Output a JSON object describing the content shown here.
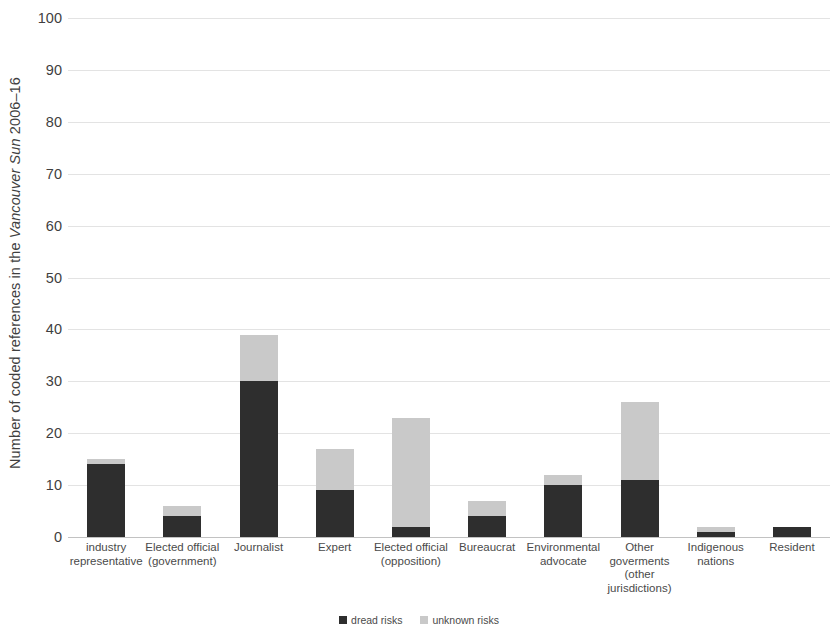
{
  "chart_data": {
    "type": "bar",
    "stacked": true,
    "title": "",
    "subtitle": "",
    "xlabel": "",
    "ylabel": "Number of coded references in the Vancouver Sun 2006–16",
    "ylabel_parts": {
      "prefix": "Number of coded references in the ",
      "italic": "Vancouver Sun",
      "suffix": " 2006–16"
    },
    "ylim": [
      0,
      100
    ],
    "ytick_values": [
      0,
      10,
      20,
      30,
      40,
      50,
      60,
      70,
      80,
      90,
      100
    ],
    "ytick_labels": [
      "0",
      "10",
      "20",
      "30",
      "40",
      "50",
      "60",
      "70",
      "80",
      "90",
      "100"
    ],
    "grid": true,
    "grid_axis": "y",
    "legend_position": "bottom-center",
    "categories": [
      "industry\nrepresentative",
      "Elected official\n(government)",
      "Journalist",
      "Expert",
      "Elected official\n(opposition)",
      "Bureaucrat",
      "Environmental\nadvocate",
      "Other\ngoverments\n(other\njurisdictions)",
      "Indigenous\nnations",
      "Resident"
    ],
    "series": [
      {
        "name": "dread risks",
        "color": "#2e2e2e",
        "values": [
          14,
          4,
          30,
          9,
          2,
          4,
          10,
          11,
          1,
          2
        ]
      },
      {
        "name": "unknown risks",
        "color": "#c9c9c9",
        "values": [
          1,
          2,
          9,
          8,
          21,
          3,
          2,
          15,
          1,
          0
        ]
      }
    ],
    "totals": [
      15,
      6,
      39,
      17,
      23,
      7,
      12,
      26,
      2,
      2
    ]
  },
  "legend": {
    "items": [
      {
        "label": "dread risks",
        "color": "#2e2e2e"
      },
      {
        "label": "unknown risks",
        "color": "#c9c9c9"
      }
    ]
  },
  "colors": {
    "dread": "#2e2e2e",
    "unknown": "#c9c9c9",
    "gridline": "#e3e3e3",
    "axis": "#c2c2c2",
    "text": "#3f3f3f",
    "background": "#ffffff"
  }
}
